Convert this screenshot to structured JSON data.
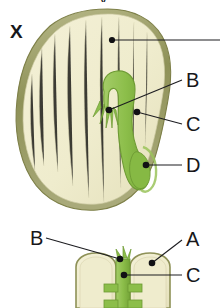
{
  "figure": {
    "background_color": "#ffffff",
    "panels": [
      {
        "id": "upper",
        "name": "longitudinal-section-of-bean-seed",
        "key_label": "X",
        "callouts": [
          {
            "letter": "",
            "name": "top-callout-clipped",
            "clipped": true
          },
          {
            "letter": "B",
            "name": "callout-b"
          },
          {
            "letter": "C",
            "name": "callout-c"
          },
          {
            "letter": "D",
            "name": "callout-d"
          }
        ]
      },
      {
        "id": "lower",
        "name": "split-bean-seed-cotyledons",
        "key_label": "",
        "callouts": [
          {
            "letter": "A",
            "name": "callout-a"
          },
          {
            "letter": "B",
            "name": "callout-b"
          },
          {
            "letter": "C",
            "name": "callout-c"
          }
        ]
      }
    ]
  },
  "labels": {
    "figure_key_x": "X",
    "top_partial": "y",
    "upper_b": "B",
    "upper_c": "C",
    "upper_d": "D",
    "lower_a": "A",
    "lower_b": "B",
    "lower_c": "C"
  },
  "colors": {
    "seed_coat_outline": "#8c8f55",
    "seed_coat_outline_light": "#b5b583",
    "cotyledon_fill": "#efeccd",
    "cotyledon_fill_shadow": "#e3dfbb",
    "embryo_green": "#8cbe4a",
    "embryo_green_dark": "#6f9c34",
    "embryo_green_light": "#a9cf6e",
    "callout_line": "#1c1c20",
    "callout_dot": "#111114",
    "text": "#17171a",
    "background": "#ffffff"
  }
}
